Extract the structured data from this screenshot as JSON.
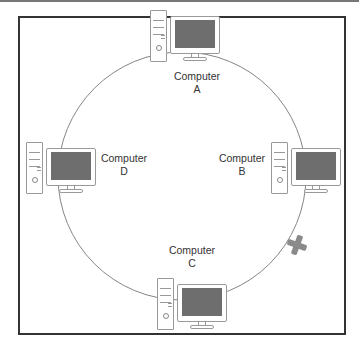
{
  "diagram": {
    "type": "ring-network-topology",
    "colors": {
      "frame": "#333333",
      "ring": "#777777",
      "screen": "#6e6e6e",
      "break_mark": "#8a8a8a"
    },
    "nodes": [
      {
        "id": "A",
        "line1": "Computer",
        "line2": "A",
        "position": "top"
      },
      {
        "id": "B",
        "line1": "Computer",
        "line2": "B",
        "position": "right"
      },
      {
        "id": "C",
        "line1": "Computer",
        "line2": "C",
        "position": "bottom"
      },
      {
        "id": "D",
        "line1": "Computer",
        "line2": "D",
        "position": "left"
      }
    ],
    "break": {
      "between": [
        "B",
        "C"
      ],
      "symbol": "cross-mark"
    }
  }
}
